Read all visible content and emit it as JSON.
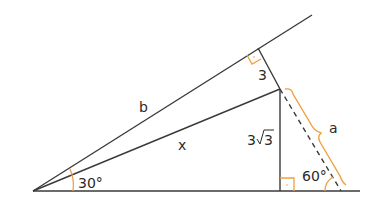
{
  "diagram": {
    "type": "geometry",
    "colors": {
      "line": "#3a3a3a",
      "accent": "#f0a040",
      "background": "#ffffff"
    },
    "labels": {
      "b": "b",
      "x": "x",
      "a": "a",
      "perp_length": "3",
      "vertical_coef": "3",
      "vertical_radicand": "3",
      "angle_origin": "30°",
      "angle_foot": "60°"
    },
    "points": {
      "O": [
        33,
        191
      ],
      "P": [
        280,
        89
      ],
      "H": [
        280,
        191
      ],
      "F": [
        258,
        48
      ],
      "D": [
        341,
        191
      ],
      "B_end": [
        312,
        15
      ],
      "base_end": [
        360,
        191
      ]
    }
  }
}
